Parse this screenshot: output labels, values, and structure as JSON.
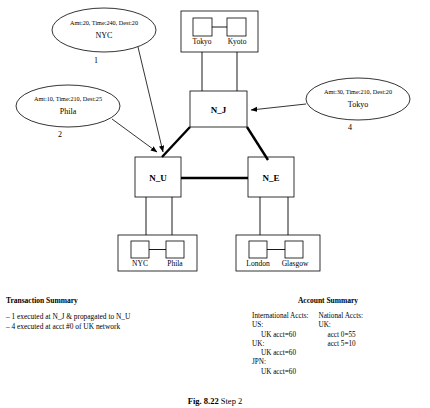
{
  "figure": {
    "caption_label": "Fig. 8.22",
    "caption_rest": "Step 2"
  },
  "diagram": {
    "nodes": [
      {
        "id": "N_J",
        "label": "N_J"
      },
      {
        "id": "N_U",
        "label": "N_U"
      },
      {
        "id": "N_E",
        "label": "N_E"
      }
    ],
    "clusters": [
      {
        "id": "jpn-cluster",
        "parent": "N_J",
        "leaves": [
          {
            "label": "Tokyo"
          },
          {
            "label": "Kyoto"
          }
        ]
      },
      {
        "id": "us-cluster",
        "parent": "N_U",
        "leaves": [
          {
            "label": "NYC"
          },
          {
            "label": "Phila"
          }
        ]
      },
      {
        "id": "uk-cluster",
        "parent": "N_E",
        "leaves": [
          {
            "label": "London"
          },
          {
            "label": "Glasgow"
          }
        ]
      }
    ],
    "messages": [
      {
        "id": "msg-1",
        "details": "Amt:20, Time:240, Dest:20",
        "origin": "NYC",
        "number": "1"
      },
      {
        "id": "msg-2",
        "details": "Amt:10, Time:210, Dest:25",
        "origin": "Phila",
        "number": "2"
      },
      {
        "id": "msg-4",
        "details": "Amt:30, Time:210, Dest:20",
        "origin": "Tokyo",
        "number": "4"
      }
    ]
  },
  "transaction_summary": {
    "title": "Transaction Summary",
    "lines": [
      "– 1 executed at N_J & propagated to N_U",
      "– 4 executed at acct #0 of UK network"
    ]
  },
  "account_summary": {
    "title": "Account Summary",
    "international": {
      "heading": "International Accts:",
      "entries": [
        {
          "group": "US:",
          "value": "UK acct=60"
        },
        {
          "group": "UK:",
          "value": "UK acct=60"
        },
        {
          "group": "JPN:",
          "value": "UK acct=60"
        }
      ]
    },
    "national": {
      "heading": "National Accts:",
      "group": "UK:",
      "values": [
        "acct 0=55",
        "acct 5=10"
      ]
    }
  }
}
